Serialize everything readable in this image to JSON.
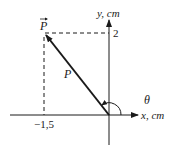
{
  "diagram": {
    "type": "vector-components",
    "vector_label": "P",
    "vector_arrow_label": "P",
    "magnitude_label": "P",
    "angle_label": "θ",
    "x_axis_label": "x, cm",
    "y_axis_label": "y, cm",
    "x_component_value": "−1,5",
    "y_component_value": "2",
    "colors": {
      "line": "#1a1a1a",
      "background": "#ffffff"
    }
  }
}
